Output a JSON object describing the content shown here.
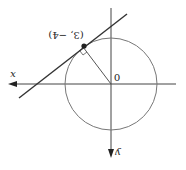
{
  "diagram": {
    "orientation": "rotated 180 degrees",
    "labels": {
      "x_axis": "x",
      "y_axis": "y",
      "origin": "0",
      "point": "(3, −4)"
    },
    "colors": {
      "axis": "#444444",
      "circle": "#666666",
      "tangent": "#333333",
      "point": "#222222"
    }
  }
}
